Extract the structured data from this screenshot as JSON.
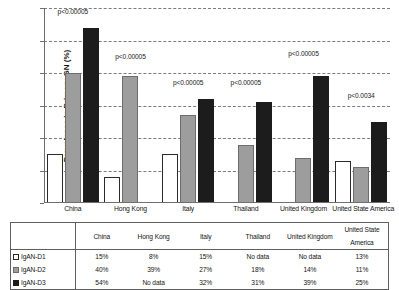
{
  "chart_data": {
    "type": "bar",
    "title": "",
    "xlabel": "",
    "ylabel": "Prevalence in Primary GN (%)",
    "ylim": [
      0,
      60
    ],
    "ytick_labels": [
      "0%",
      "10%",
      "20%",
      "30%",
      "40%",
      "50%",
      "60%"
    ],
    "ytick_values": [
      0,
      10,
      20,
      30,
      40,
      50,
      60
    ],
    "grid": true,
    "legend_position": "table-below",
    "categories": [
      "China",
      "Hong Kong",
      "Italy",
      "Thailand",
      "United Kingdom",
      "United State America"
    ],
    "series": [
      {
        "name": "IgAN-D1",
        "values": [
          15,
          8,
          15,
          null,
          null,
          13
        ],
        "labels": [
          "15%",
          "8%",
          "15%",
          "No data",
          "No data",
          "13%"
        ],
        "color": "#ffffff"
      },
      {
        "name": "IgAN-D2",
        "values": [
          40,
          39,
          27,
          18,
          14,
          11
        ],
        "labels": [
          "40%",
          "39%",
          "27%",
          "18%",
          "14%",
          "11%"
        ],
        "color": "#9d9d9d"
      },
      {
        "name": "IgAN-D3",
        "values": [
          54,
          null,
          32,
          31,
          39,
          25
        ],
        "labels": [
          "54%",
          "No data",
          "32%",
          "31%",
          "39%",
          "25%"
        ],
        "color": "#1c1c1c"
      }
    ],
    "annotations": [
      {
        "category": "China",
        "text": "p<0.00005",
        "value": 58
      },
      {
        "category": "Hong Kong",
        "text": "p<0.00005",
        "value": 44
      },
      {
        "category": "Italy",
        "text": "p<0.00005",
        "value": 36
      },
      {
        "category": "Thailand",
        "text": "p<0.00005",
        "value": 36
      },
      {
        "category": "United Kingdom",
        "text": "p<0.00005",
        "value": 45
      },
      {
        "category": "United State America",
        "text": "p<0.0034",
        "value": 32
      }
    ]
  },
  "table": {
    "row_keys": [
      "IgAN-D1",
      "IgAN-D2",
      "IgAN-D3"
    ],
    "header": [
      "",
      "China",
      "Hong Kong",
      "Italy",
      "Thailand",
      "United Kingdom",
      "United State America"
    ],
    "rows": [
      [
        "15%",
        "8%",
        "15%",
        "No data",
        "No data",
        "13%"
      ],
      [
        "40%",
        "39%",
        "27%",
        "18%",
        "14%",
        "11%"
      ],
      [
        "54%",
        "No data",
        "32%",
        "31%",
        "39%",
        "25%"
      ]
    ]
  }
}
